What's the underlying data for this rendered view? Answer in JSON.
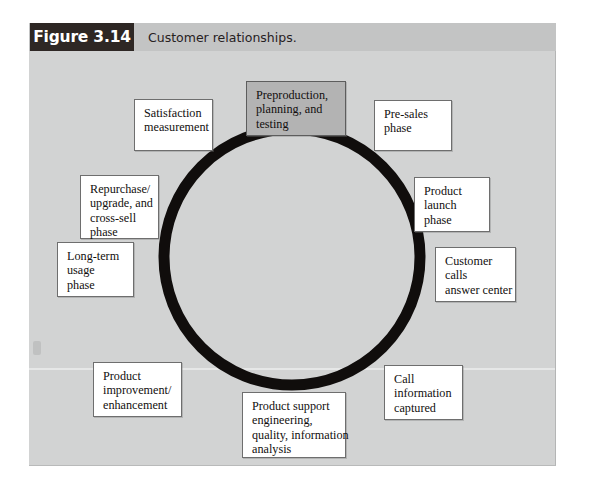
{
  "figure": {
    "number": "Figure 3.14",
    "caption": "Customer relationships.",
    "header_bg": "#c3c4c4",
    "number_block_bg": "#2e2724",
    "body_bg": "#d2d3d3",
    "ring_color": "#100d0c",
    "highlight_node_bg": "#b3b3b3"
  },
  "diagram": {
    "type": "cycle",
    "shape": "ring",
    "node_count": 10,
    "nodes": [
      {
        "id": "preproduction",
        "highlighted": true,
        "lines": [
          "Preproduction,",
          "planning, and",
          "testing"
        ]
      },
      {
        "id": "pre-sales-phase",
        "highlighted": false,
        "lines": [
          "Pre-sales",
          "phase"
        ]
      },
      {
        "id": "product-launch-phase",
        "highlighted": false,
        "lines": [
          "Product",
          "launch",
          "phase"
        ]
      },
      {
        "id": "customer-calls-answer-center",
        "highlighted": false,
        "lines": [
          "Customer",
          "calls",
          "answer center"
        ]
      },
      {
        "id": "call-information-captured",
        "highlighted": false,
        "lines": [
          "Call",
          "information",
          "captured"
        ]
      },
      {
        "id": "product-support-engineering",
        "highlighted": false,
        "lines": [
          "Product support",
          "engineering,",
          "quality, information",
          "analysis"
        ]
      },
      {
        "id": "product-improvement-enhancement",
        "highlighted": false,
        "lines": [
          "Product",
          "improvement/",
          "enhancement"
        ]
      },
      {
        "id": "long-term-usage-phase",
        "highlighted": false,
        "lines": [
          "Long-term",
          "usage",
          "phase"
        ]
      },
      {
        "id": "repurchase-upgrade-cross-sell-phase",
        "highlighted": false,
        "lines": [
          "Repurchase/",
          "upgrade, and",
          "cross-sell",
          "phase"
        ]
      },
      {
        "id": "satisfaction-measurement",
        "highlighted": false,
        "lines": [
          "Satisfaction",
          "measurement"
        ]
      }
    ]
  }
}
